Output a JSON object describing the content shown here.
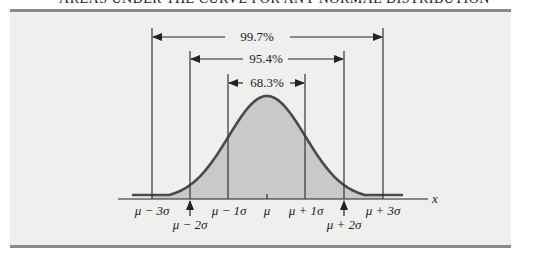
{
  "title": "AREAS UNDER THE CURVE FOR ANY NORMAL DISTRIBUTION",
  "chart_data": {
    "type": "area",
    "title": "Areas under the curve for any normal distribution",
    "xlabel": "x",
    "ylabel": "",
    "distribution": "normal",
    "tick_labels": [
      "μ − 3σ",
      "μ − 2σ",
      "μ − 1σ",
      "μ",
      "μ + 1σ",
      "μ + 2σ",
      "μ + 3σ"
    ],
    "tick_positions_sigma": [
      -3,
      -2,
      -1,
      0,
      1,
      2,
      3
    ],
    "intervals": [
      {
        "label": "68.3%",
        "from_sigma": -1,
        "to_sigma": 1,
        "value": 68.3
      },
      {
        "label": "95.4%",
        "from_sigma": -2,
        "to_sigma": 2,
        "value": 95.4
      },
      {
        "label": "99.7%",
        "from_sigma": -3,
        "to_sigma": 3,
        "value": 99.7
      }
    ],
    "shaded_region_sigma": [
      -3,
      3
    ],
    "grid": false,
    "legend": "none"
  },
  "labels": {
    "pct_99": "99.7%",
    "pct_95": "95.4%",
    "pct_68": "68.3%",
    "x_axis": "x",
    "m3": "μ − 3σ",
    "m2": "μ − 2σ",
    "m1": "μ − 1σ",
    "mu": "μ",
    "p1": "μ + 1σ",
    "p2": "μ + 2σ",
    "p3": "μ + 3σ"
  },
  "colors": {
    "curve": "#4a4a4a",
    "fill": "#c9c9c7",
    "panel": "#efefed",
    "rule": "#8a8a8a",
    "ink": "#222222"
  }
}
